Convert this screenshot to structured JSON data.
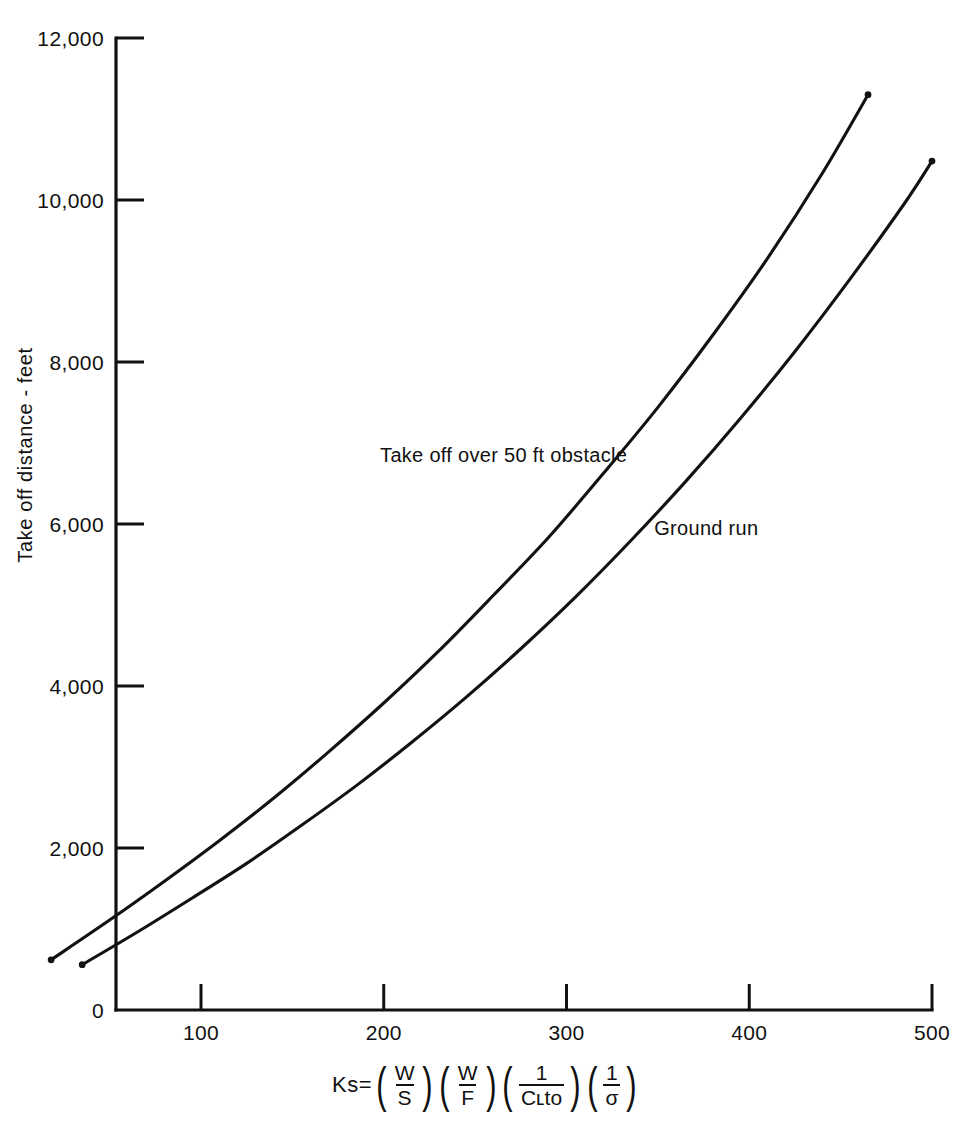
{
  "chart_data": {
    "type": "line",
    "title": "",
    "subtitle": "",
    "xlabel": "Ks=(W/S)(W/F)(1/CLto)(1/σ)",
    "ylabel": "Take off distance - feet",
    "xlim": [
      0,
      500
    ],
    "ylim": [
      0,
      12000
    ],
    "grid": false,
    "legend_position": "inline-annotation",
    "x_ticks": [
      100,
      200,
      300,
      400,
      500
    ],
    "x_tick_labels": [
      "100",
      "200",
      "300",
      "400",
      "500"
    ],
    "y_ticks": [
      0,
      2000,
      4000,
      6000,
      8000,
      10000,
      12000
    ],
    "y_tick_labels": [
      "0",
      "2,000",
      "4,000",
      "6,000",
      "8,000",
      "10,000",
      "12,000"
    ],
    "series": [
      {
        "name": "Take off over 50 ft obstacle",
        "x": [
          18,
          50,
          80,
          110,
          140,
          170,
          200,
          230,
          260,
          290,
          320,
          350,
          380,
          410,
          440,
          465
        ],
        "y": [
          620,
          1110,
          1590,
          2090,
          2620,
          3190,
          3790,
          4430,
          5120,
          5830,
          6620,
          7440,
          8330,
          9280,
          10330,
          11300
        ]
      },
      {
        "name": "Ground run",
        "x": [
          35,
          65,
          95,
          125,
          155,
          185,
          215,
          245,
          275,
          305,
          335,
          365,
          395,
          425,
          455,
          485,
          500
        ],
        "y": [
          560,
          960,
          1380,
          1810,
          2280,
          2770,
          3300,
          3860,
          4460,
          5100,
          5790,
          6520,
          7300,
          8130,
          9020,
          9960,
          10480
        ]
      }
    ],
    "annotations": [
      {
        "text": "Take off over 50 ft obstacle",
        "x": 198,
        "y": 6760
      },
      {
        "text": "Ground run",
        "x": 348,
        "y": 5860
      }
    ]
  },
  "axis": {
    "y_title": "Take off distance - feet",
    "x_title_lead": "Ks=",
    "x_formula": {
      "terms": [
        {
          "num": "W",
          "den": "S"
        },
        {
          "num": "W",
          "den": "F"
        },
        {
          "num": "1",
          "den": "Cʟto"
        },
        {
          "num": "1",
          "den": "σ"
        }
      ],
      "paren_open": "(",
      "paren_close": ")"
    }
  },
  "style": {
    "ink": "#111111",
    "background": "#ffffff",
    "curve_color": "#121212"
  }
}
